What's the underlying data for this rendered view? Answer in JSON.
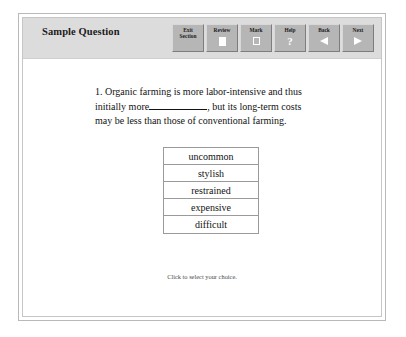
{
  "window": {
    "title": "Sample Question"
  },
  "toolbar": {
    "buttons": [
      {
        "label_line1": "Exit",
        "label_line2": "Section",
        "icon": "none"
      },
      {
        "label_line1": "Review",
        "label_line2": "",
        "icon": "page-icon"
      },
      {
        "label_line1": "Mark",
        "label_line2": "",
        "icon": "checkbox-icon"
      },
      {
        "label_line1": "Help",
        "label_line2": "",
        "icon": "question-mark-icon"
      },
      {
        "label_line1": "Back",
        "label_line2": "",
        "icon": "triangle-left-icon"
      },
      {
        "label_line1": "Next",
        "label_line2": "",
        "icon": "triangle-right-icon"
      }
    ]
  },
  "question": {
    "number": "1.",
    "text_before_blank": "Organic farming is more labor-intensive and thus initially more",
    "blank": "__________",
    "text_after_blank": ", but its long-term costs may be less than those of conventional farming."
  },
  "choices": [
    {
      "label": "uncommon"
    },
    {
      "label": "stylish"
    },
    {
      "label": "restrained"
    },
    {
      "label": "expensive"
    },
    {
      "label": "difficult"
    }
  ],
  "footer": {
    "hint": "Click to select your choice."
  },
  "colors": {
    "header_band": "#dcdcdc",
    "button_face": "#b6b6b6",
    "frame_border": "#b9b9b9",
    "choice_border": "#9a9a9a",
    "page_background": "#ffffff",
    "text": "#121212"
  }
}
